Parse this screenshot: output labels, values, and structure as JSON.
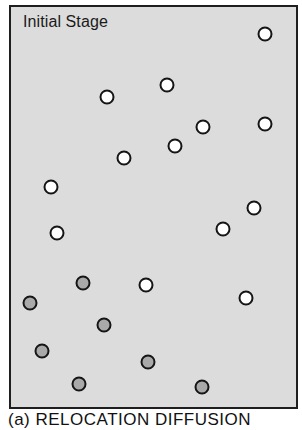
{
  "figure": {
    "stage_label": "Initial Stage",
    "caption": "(a) RELOCATION DIFFUSION",
    "colors": {
      "panel_background": "#dcdcdc",
      "border": "#1e1e1e",
      "outline": "#151515",
      "empty_fill": "#ffffff",
      "filled_fill": "#a9a9a9"
    },
    "particles": [
      {
        "x": 265,
        "y": 34,
        "type": "empty"
      },
      {
        "x": 167,
        "y": 85,
        "type": "empty"
      },
      {
        "x": 107,
        "y": 97,
        "type": "empty"
      },
      {
        "x": 265,
        "y": 124,
        "type": "empty"
      },
      {
        "x": 203,
        "y": 127,
        "type": "empty"
      },
      {
        "x": 175,
        "y": 146,
        "type": "empty"
      },
      {
        "x": 124,
        "y": 158,
        "type": "empty"
      },
      {
        "x": 51,
        "y": 187,
        "type": "empty"
      },
      {
        "x": 254,
        "y": 208,
        "type": "empty"
      },
      {
        "x": 223,
        "y": 229,
        "type": "empty"
      },
      {
        "x": 57,
        "y": 233,
        "type": "empty"
      },
      {
        "x": 83,
        "y": 283,
        "type": "filled"
      },
      {
        "x": 146,
        "y": 285,
        "type": "empty"
      },
      {
        "x": 246,
        "y": 298,
        "type": "empty"
      },
      {
        "x": 30,
        "y": 303,
        "type": "filled"
      },
      {
        "x": 104,
        "y": 325,
        "type": "filled"
      },
      {
        "x": 42,
        "y": 351,
        "type": "filled"
      },
      {
        "x": 148,
        "y": 362,
        "type": "filled"
      },
      {
        "x": 79,
        "y": 384,
        "type": "filled"
      },
      {
        "x": 202,
        "y": 387,
        "type": "filled"
      }
    ]
  }
}
